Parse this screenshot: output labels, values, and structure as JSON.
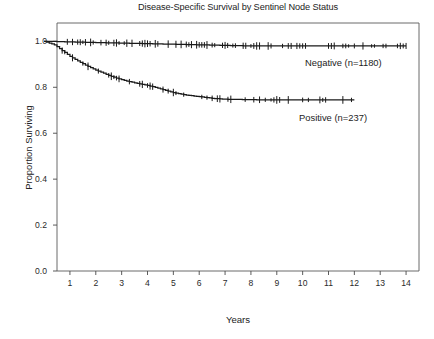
{
  "chart_data": {
    "type": "line",
    "title": "Disease-Specific Survival by Sentinel Node Status",
    "subtitle": "",
    "xlabel": "Years",
    "ylabel": "Proportion Surviving",
    "xlim": [
      0.5,
      14.5
    ],
    "ylim": [
      0.0,
      1.08
    ],
    "grid": false,
    "legend_position": "inline-annotation",
    "xticks": [
      1,
      2,
      3,
      4,
      5,
      6,
      7,
      8,
      9,
      10,
      11,
      12,
      13,
      14
    ],
    "xtick_labels": [
      "1",
      "2",
      "3",
      "4",
      "5",
      "6",
      "7",
      "8",
      "9",
      "10",
      "11",
      "12",
      "13",
      "14"
    ],
    "yticks": [
      0.0,
      0.2,
      0.4,
      0.6,
      0.8,
      1.0
    ],
    "ytick_labels": [
      "0.0",
      "0.2",
      "0.4",
      "0.6",
      "0.8",
      "1.0"
    ],
    "annotations": [
      {
        "text": "Negative (n=1180)",
        "x": 10.5,
        "y": 0.93
      },
      {
        "text": "Positive (n=237)",
        "x": 10.2,
        "y": 0.69
      }
    ],
    "series": [
      {
        "name": "Negative (n=1180)",
        "n": 1180,
        "label": "Negative (n=1180)",
        "color": "#1a1a1a",
        "censor_marks": true,
        "x": [
          0.0,
          0.3,
          0.6,
          0.9,
          1.2,
          1.6,
          2.0,
          2.4,
          2.8,
          3.2,
          3.6,
          4.0,
          4.4,
          4.8,
          5.2,
          5.6,
          6.0,
          6.4,
          6.8,
          7.2,
          7.6,
          8.0,
          9.0,
          10.0,
          11.0,
          12.0,
          13.0,
          14.0
        ],
        "y": [
          1.0,
          1.0,
          0.999,
          0.998,
          0.997,
          0.996,
          0.995,
          0.994,
          0.993,
          0.992,
          0.991,
          0.99,
          0.989,
          0.988,
          0.987,
          0.986,
          0.985,
          0.984,
          0.983,
          0.982,
          0.981,
          0.98,
          0.98,
          0.98,
          0.98,
          0.98,
          0.98,
          0.98
        ]
      },
      {
        "name": "Positive (n=237)",
        "n": 237,
        "label": "Positive (n=237)",
        "color": "#1a1a1a",
        "censor_marks": true,
        "x": [
          0.0,
          0.4,
          0.7,
          1.0,
          1.3,
          1.6,
          1.9,
          2.2,
          2.5,
          2.8,
          3.1,
          3.4,
          3.7,
          4.0,
          4.3,
          4.6,
          4.9,
          5.2,
          5.5,
          5.8,
          6.1,
          6.5,
          7.0,
          8.0,
          9.0,
          10.0,
          11.0,
          12.0
        ],
        "y": [
          1.0,
          0.985,
          0.96,
          0.935,
          0.915,
          0.897,
          0.88,
          0.866,
          0.852,
          0.84,
          0.83,
          0.822,
          0.815,
          0.808,
          0.8,
          0.79,
          0.78,
          0.772,
          0.766,
          0.762,
          0.758,
          0.752,
          0.748,
          0.746,
          0.745,
          0.745,
          0.745,
          0.745
        ]
      }
    ]
  },
  "caption": {
    "text": ""
  }
}
